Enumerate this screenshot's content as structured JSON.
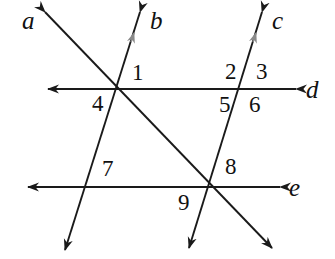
{
  "figure": {
    "type": "geometry-diagram",
    "width": 335,
    "height": 259,
    "background_color": "#ffffff",
    "stroke_color": "#1a1a1a",
    "parallel_mark_color": "#8a8a8a"
  },
  "line_labels": [
    {
      "id": "line-label-a",
      "text": "a",
      "x": 22,
      "y": 8
    },
    {
      "id": "line-label-b",
      "text": "b",
      "x": 150,
      "y": 8
    },
    {
      "id": "line-label-c",
      "text": "c",
      "x": 272,
      "y": 8
    },
    {
      "id": "line-label-d",
      "text": "d",
      "x": 306,
      "y": 77
    },
    {
      "id": "line-label-e",
      "text": "e",
      "x": 289,
      "y": 175
    }
  ],
  "angle_labels": [
    {
      "id": "angle-label-1",
      "text": "1",
      "x": 132,
      "y": 61
    },
    {
      "id": "angle-label-2",
      "text": "2",
      "x": 225,
      "y": 60
    },
    {
      "id": "angle-label-3",
      "text": "3",
      "x": 256,
      "y": 60
    },
    {
      "id": "angle-label-4",
      "text": "4",
      "x": 92,
      "y": 92
    },
    {
      "id": "angle-label-5",
      "text": "5",
      "x": 219,
      "y": 93
    },
    {
      "id": "angle-label-6",
      "text": "6",
      "x": 249,
      "y": 93
    },
    {
      "id": "angle-label-7",
      "text": "7",
      "x": 102,
      "y": 157
    },
    {
      "id": "angle-label-8",
      "text": "8",
      "x": 225,
      "y": 155
    },
    {
      "id": "angle-label-9",
      "text": "9",
      "x": 178,
      "y": 191
    }
  ],
  "lines": [
    {
      "id": "line-a",
      "name": "a",
      "from": {
        "x": 45,
        "y": 12
      },
      "to": {
        "x": 272,
        "y": 248
      },
      "arrows": "both",
      "parallel_mark": false
    },
    {
      "id": "line-b",
      "name": "b",
      "from": {
        "x": 140,
        "y": 12
      },
      "to": {
        "x": 65,
        "y": 250
      },
      "arrows": "both",
      "parallel_mark": true
    },
    {
      "id": "line-c",
      "name": "c",
      "from": {
        "x": 262,
        "y": 12
      },
      "to": {
        "x": 189,
        "y": 248
      },
      "arrows": "both",
      "parallel_mark": true
    },
    {
      "id": "line-d",
      "name": "d",
      "from": {
        "x": 296,
        "y": 89
      },
      "to": {
        "x": 48,
        "y": 89
      },
      "arrows": "both",
      "parallel_mark": false
    },
    {
      "id": "line-e",
      "name": "e",
      "from": {
        "x": 280,
        "y": 187
      },
      "to": {
        "x": 28,
        "y": 187
      },
      "arrows": "both",
      "parallel_mark": false
    }
  ],
  "intersections": [
    {
      "id": "intersection-abd",
      "lines": [
        "a",
        "b",
        "d"
      ],
      "x": 118,
      "y": 89
    },
    {
      "id": "intersection-cd",
      "lines": [
        "c",
        "d"
      ],
      "x": 242,
      "y": 89
    },
    {
      "id": "intersection-be",
      "lines": [
        "b",
        "e"
      ],
      "x": 85,
      "y": 187
    },
    {
      "id": "intersection-ace",
      "lines": [
        "a",
        "c",
        "e"
      ],
      "x": 208,
      "y": 187
    }
  ]
}
